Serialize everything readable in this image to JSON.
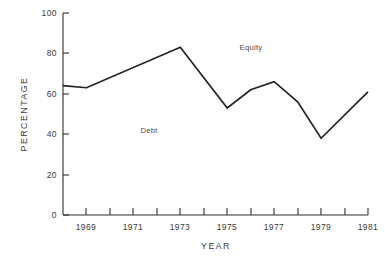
{
  "chart_data": {
    "type": "line",
    "title": "",
    "xlabel": "YEAR",
    "ylabel": "PERCENTAGE",
    "xlim": [
      1968,
      1981
    ],
    "ylim": [
      0,
      100
    ],
    "grid": false,
    "legend": "none",
    "y_ticks": [
      0,
      20,
      40,
      60,
      80,
      100
    ],
    "y_tick_labels": [
      "0",
      "20",
      "40",
      "60",
      "80",
      "100"
    ],
    "x_ticks": [
      1968,
      1969,
      1970,
      1971,
      1972,
      1973,
      1974,
      1975,
      1976,
      1977,
      1978,
      1979,
      1980,
      1981
    ],
    "x_tick_labels": [
      "",
      "1969",
      "",
      "1971",
      "",
      "1973",
      "",
      "1975",
      "",
      "1977",
      "",
      "1979",
      "",
      "1981"
    ],
    "x": [
      1968,
      1969,
      1973,
      1975,
      1976,
      1977,
      1978,
      1979,
      1981
    ],
    "values": [
      64,
      63,
      83,
      53,
      62,
      66,
      56,
      38,
      61
    ],
    "series": [
      {
        "name": "Equity / Debt boundary",
        "x": [
          1968,
          1969,
          1973,
          1975,
          1976,
          1977,
          1978,
          1979,
          1981
        ],
        "values": [
          64,
          63,
          83,
          53,
          62,
          66,
          56,
          38,
          61
        ]
      }
    ],
    "annotations": [
      {
        "text": "Equity",
        "x": 1975,
        "y": 83
      },
      {
        "text": "Debt",
        "x": 1971,
        "y": 42
      }
    ],
    "colors": {
      "line": "#222222",
      "axis": "#2f2f2f",
      "text": "#3a3a3a",
      "background": "#ffffff"
    }
  },
  "axes": {
    "y_title": "PERCENTAGE",
    "x_title": "YEAR",
    "y_labels": {
      "t0": "0",
      "t20": "20",
      "t40": "40",
      "t60": "60",
      "t80": "80",
      "t100": "100"
    },
    "x_labels": {
      "y1969": "1969",
      "y1971": "1971",
      "y1973": "1973",
      "y1975": "1975",
      "y1977": "1977",
      "y1979": "1979",
      "y1981": "1981"
    }
  },
  "annotations": {
    "equity": "Equity",
    "debt": "Debt"
  }
}
